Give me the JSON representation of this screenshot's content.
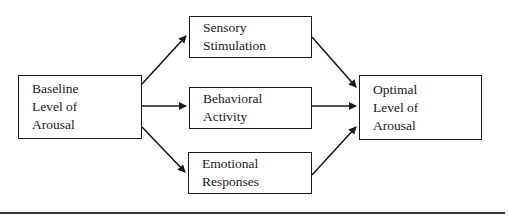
{
  "diagram": {
    "nodes": [
      {
        "id": "baseline",
        "lines": [
          "Baseline",
          "Level of",
          "Arousal"
        ]
      },
      {
        "id": "sensory",
        "lines": [
          "Sensory",
          "Stimulation"
        ]
      },
      {
        "id": "behavioral",
        "lines": [
          "Behavioral",
          "Activity"
        ]
      },
      {
        "id": "emotional",
        "lines": [
          "Emotional",
          "Responses"
        ]
      },
      {
        "id": "optimal",
        "lines": [
          "Optimal",
          "Level of",
          "Arousal"
        ]
      }
    ],
    "edges": [
      {
        "from": "baseline",
        "to": "sensory"
      },
      {
        "from": "baseline",
        "to": "behavioral"
      },
      {
        "from": "baseline",
        "to": "emotional"
      },
      {
        "from": "sensory",
        "to": "optimal"
      },
      {
        "from": "behavioral",
        "to": "optimal"
      },
      {
        "from": "emotional",
        "to": "optimal"
      }
    ],
    "colors": {
      "stroke": "#1a1a1a",
      "background": "#ffffff",
      "rule": "#3a3a3a"
    }
  }
}
